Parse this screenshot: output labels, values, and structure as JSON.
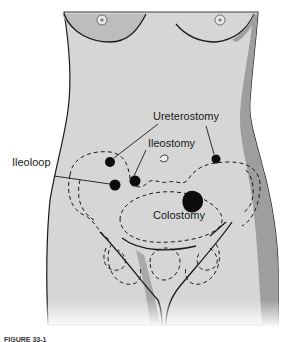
{
  "figure": {
    "caption": "FIGURE 33-1"
  },
  "labels": [
    {
      "id": "ureterostomy",
      "text": "Ureterostomy"
    },
    {
      "id": "ileostomy",
      "text": "Ileostomy"
    },
    {
      "id": "ileoloop",
      "text": "Ileoloop"
    },
    {
      "id": "colostomy",
      "text": "Colostomy"
    }
  ],
  "colors": {
    "skin": "#d6d6d6",
    "shadow": "#9a9a9a",
    "outline": "#1a1a1a",
    "stoma": "#0d0d0d"
  }
}
